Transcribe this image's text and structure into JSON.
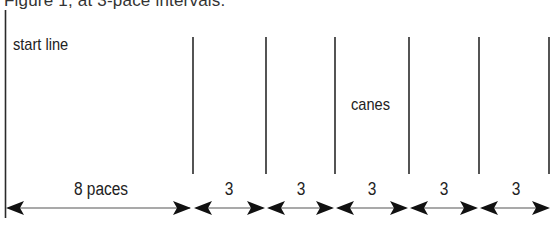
{
  "caption": "Figure 1, at 3-pace intervals.",
  "labels": {
    "start_line": "start line",
    "canes": "canes"
  },
  "intervals": [
    {
      "label": "8 paces",
      "x_start": 5,
      "x_end": 193
    },
    {
      "label": "3",
      "x_start": 193,
      "x_end": 266
    },
    {
      "label": "3",
      "x_start": 266,
      "x_end": 335
    },
    {
      "label": "3",
      "x_start": 335,
      "x_end": 409
    },
    {
      "label": "3",
      "x_start": 409,
      "x_end": 479
    },
    {
      "label": "3",
      "x_start": 479,
      "x_end": 549
    }
  ],
  "cane_positions_x": [
    193,
    266,
    335,
    409,
    479,
    549
  ],
  "colors": {
    "line": "#2a2a2a",
    "arrow": "#111111",
    "text": "#222222"
  }
}
